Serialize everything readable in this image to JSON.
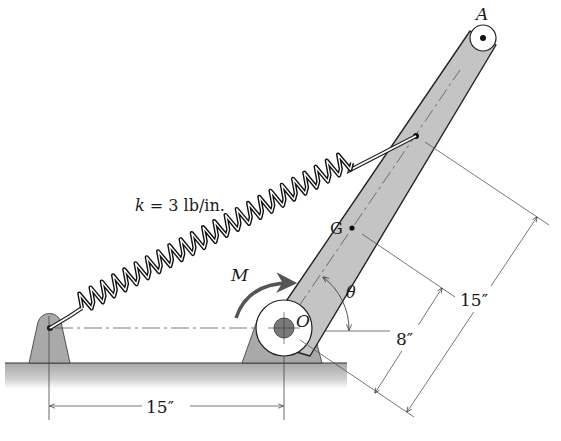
{
  "figure": {
    "type": "mechanics-diagram"
  },
  "labels": {
    "point_A": "A",
    "point_G": "G",
    "point_O": "O",
    "moment": "M",
    "angle": "θ",
    "spring_constant": "k = 3 lb/in.",
    "dim_ground": "15″",
    "dim_OG": "8″",
    "dim_O_spring": "15″"
  },
  "values": {
    "k_lb_per_in": 3,
    "ground_span_in": 15,
    "OG_in": 8,
    "O_to_spring_attach_in": 15
  },
  "colors": {
    "bar_fill": "#c4c4c4",
    "support_fill": "#a9a9a9",
    "ground_fill": "#b8b8b8",
    "hub_fill": "#7a7a7a",
    "ink": "#1a1a1a",
    "moment_arrow": "#555555"
  }
}
